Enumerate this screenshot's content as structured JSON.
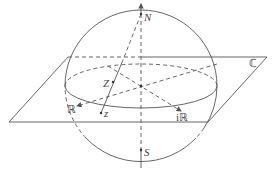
{
  "diagram": {
    "labels": {
      "north": "N",
      "south": "S",
      "sphere_point": "Z",
      "plane_point": "z",
      "real_axis": "ℝ",
      "imaginary_axis": "iℝ",
      "complex_plane": "ℂ"
    },
    "colors": {
      "stroke": "#555555",
      "text": "#444444",
      "background": "#ffffff"
    }
  }
}
